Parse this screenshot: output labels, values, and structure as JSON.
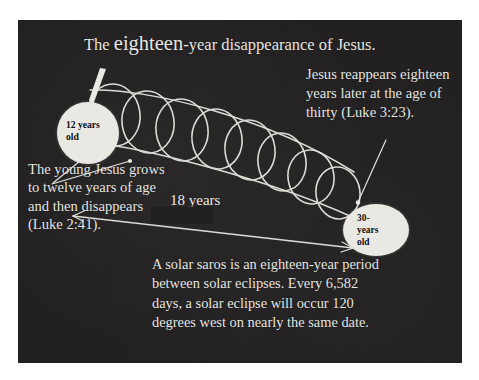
{
  "panel": {
    "background_color": "#211f20",
    "text_color": "#e8e7e3"
  },
  "title": {
    "prefix": "The ",
    "emphasis": "eighteen",
    "suffix": "-year disappearance of Jesus."
  },
  "annotations": {
    "right": "Jesus reappears eighteen years later at the age of thirty (Luke 3:23).",
    "left": "The young Jesus grows to twelve years of age and then disappears (Luke 2:41).",
    "bottom": "A solar saros is an eighteen-year period between solar eclipses. Every 6,582 days, a solar eclipse will occur 120 degrees west on nearly the same date."
  },
  "span_label": "18 years",
  "nodes": {
    "start": {
      "label": "12 years\nold",
      "fill_color": "#e9e8e2",
      "text_color": "#111014"
    },
    "end": {
      "label": "30-\nyears\nold",
      "fill_color": "#e9e8e2",
      "text_color": "#111014"
    }
  },
  "diagram": {
    "type": "coil-spiral-timeline",
    "loop_count": 8,
    "stroke_color": "#dcdbd5"
  }
}
